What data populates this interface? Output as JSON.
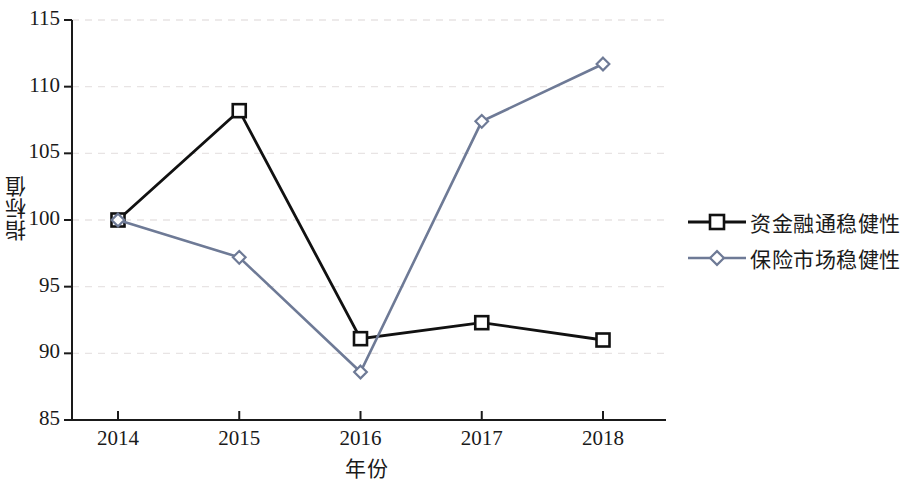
{
  "chart_data": {
    "type": "line",
    "title": "",
    "xlabel": "年份",
    "ylabel": "指标值",
    "categories": [
      "2014",
      "2015",
      "2016",
      "2017",
      "2018"
    ],
    "x_tick_labels": [
      "2014",
      "2015",
      "2016",
      "2017",
      "2018"
    ],
    "y_tick_labels": [
      "115",
      "110",
      "105",
      "100",
      "95",
      "90",
      "85"
    ],
    "y_ticks": [
      85,
      90,
      95,
      100,
      105,
      110,
      115
    ],
    "ylim": [
      85,
      115
    ],
    "grid": "horizontal-dashed-light",
    "legend_position": "right",
    "series": [
      {
        "name": "资金融通稳健性",
        "color": "#111111",
        "marker": "square-open",
        "values": [
          100.0,
          108.2,
          91.1,
          92.3,
          91.0
        ]
      },
      {
        "name": "保险市场稳健性",
        "color": "#6e7a96",
        "marker": "diamond-open",
        "values": [
          100.0,
          97.2,
          88.6,
          107.4,
          111.7
        ]
      }
    ]
  },
  "axes": {
    "y_title": "指标值",
    "x_title": "年份"
  },
  "legend": {
    "items": [
      {
        "label": "资金融通稳健性",
        "color": "#111111",
        "marker": "square-open"
      },
      {
        "label": "保险市场稳健性",
        "color": "#6e7a96",
        "marker": "diamond-open"
      }
    ]
  }
}
